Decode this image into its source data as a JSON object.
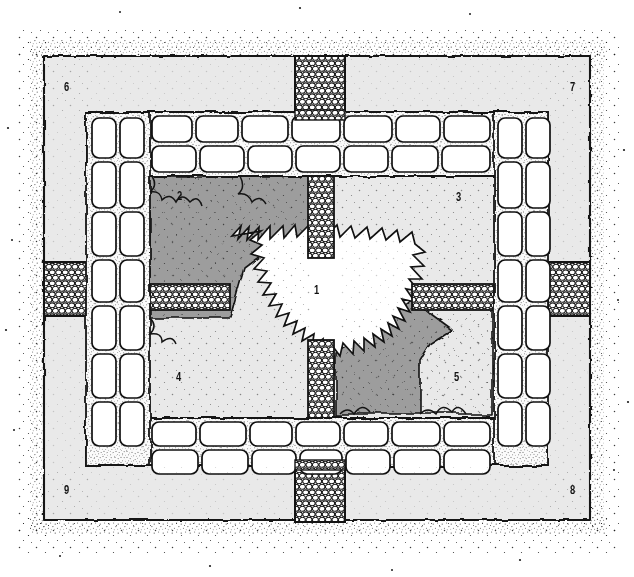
{
  "map": {
    "title": "Dungeon floorplan map",
    "style": "hand-drawn ink hatching",
    "canvas": {
      "width": 634,
      "height": 577
    },
    "colors": {
      "background": "#ffffff",
      "ink": "#101010",
      "floor_light": "#e9e9e9",
      "floor_dark": "#9d9d9d",
      "chamber_white": "#ffffff",
      "stone_fill": "#fefefe",
      "stipple": "#1a1a1a"
    },
    "legend_note": "Numbers label rooms / areas",
    "rooms": [
      {
        "id": "1",
        "label": "1",
        "kind": "central-chamber",
        "fill": "white",
        "x": 316,
        "y": 289
      },
      {
        "id": "2",
        "label": "2",
        "kind": "cavern",
        "fill": "dark-gray",
        "x": 180,
        "y": 195
      },
      {
        "id": "3",
        "label": "3",
        "kind": "hall",
        "fill": "light-gray",
        "x": 458,
        "y": 196
      },
      {
        "id": "4",
        "label": "4",
        "kind": "hall",
        "fill": "light-gray",
        "x": 178,
        "y": 376
      },
      {
        "id": "5",
        "label": "5",
        "kind": "cavern",
        "fill": "dark-gray",
        "x": 456,
        "y": 376
      },
      {
        "id": "6",
        "label": "6",
        "kind": "outer-corridor",
        "fill": "light-gray",
        "x": 67,
        "y": 86
      },
      {
        "id": "7",
        "label": "7",
        "kind": "outer-corridor",
        "fill": "light-gray",
        "x": 573,
        "y": 86
      },
      {
        "id": "8",
        "label": "8",
        "kind": "outer-corridor",
        "fill": "light-gray",
        "x": 573,
        "y": 489
      },
      {
        "id": "9",
        "label": "9",
        "kind": "outer-corridor",
        "fill": "light-gray",
        "x": 67,
        "y": 489
      }
    ],
    "passages": [
      {
        "name": "north-cobble-passage",
        "orientation": "vertical",
        "x": 295,
        "y": 56,
        "w": 50,
        "h": 62
      },
      {
        "name": "center-cobble-passage-north",
        "orientation": "vertical",
        "x": 308,
        "y": 178,
        "w": 26,
        "h": 78
      },
      {
        "name": "west-cobble-passage",
        "orientation": "horizontal",
        "x": 40,
        "y": 262,
        "w": 50,
        "h": 54
      },
      {
        "name": "inner-west-cobble-passage",
        "orientation": "horizontal",
        "x": 150,
        "y": 284,
        "w": 80,
        "h": 26
      },
      {
        "name": "east-cobble-passage",
        "orientation": "horizontal",
        "x": 548,
        "y": 262,
        "w": 52,
        "h": 54
      },
      {
        "name": "inner-east-cobble-passage",
        "orientation": "horizontal",
        "x": 412,
        "y": 284,
        "w": 80,
        "h": 26
      },
      {
        "name": "center-cobble-passage-south",
        "orientation": "vertical",
        "x": 308,
        "y": 340,
        "w": 26,
        "h": 78
      },
      {
        "name": "south-cobble-passage",
        "orientation": "vertical",
        "x": 295,
        "y": 462,
        "w": 50,
        "h": 62
      }
    ],
    "walls": {
      "north_wall_row_count": 2,
      "south_wall_row_count": 2,
      "west_wall_col_count": 2,
      "east_wall_col_count": 2,
      "block_style": "rounded rectangular ashlar with stippled mortar"
    }
  }
}
